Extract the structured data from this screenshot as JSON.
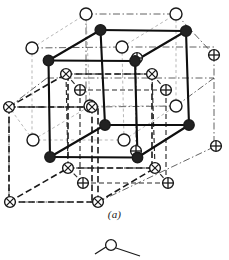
{
  "figure": {
    "caption": "(a)",
    "caption_letter": "a",
    "colors": {
      "line": "#1a1a1a",
      "filled_atom": "#222222",
      "open_atom": "#ffffff",
      "stroke": "#1a1a1a",
      "background": "#ffffff",
      "faint_line": "#7a7a7a"
    },
    "legend_atom_types": [
      {
        "key": "filled",
        "symbol": "filled-circle",
        "name": "filled-atom"
      },
      {
        "key": "open",
        "symbol": "open-circle",
        "name": "open-atom"
      },
      {
        "key": "cross",
        "symbol": "circle-with-x",
        "name": "x-cross-atom"
      },
      {
        "key": "plus",
        "symbol": "circle-with-plus",
        "name": "plus-cross-atom"
      }
    ],
    "geometry": {
      "comment_axes": "projection vectors used to place lattice sites",
      "origin": [
        50,
        157
      ],
      "vec_x": [
        68,
        0
      ],
      "vec_y": [
        0,
        -68
      ],
      "vec_z": [
        38,
        -29
      ]
    },
    "atoms": {
      "filled": [
        {
          "x": 48.5,
          "y": 60.5,
          "r": 5.2
        },
        {
          "x": 100.5,
          "y": 30.0,
          "r": 5.4
        },
        {
          "x": 186.0,
          "y": 31.0,
          "r": 5.4
        },
        {
          "x": 135.0,
          "y": 61.0,
          "r": 5.2
        },
        {
          "x": 50.0,
          "y": 157.0,
          "r": 5.2
        },
        {
          "x": 105.0,
          "y": 125.0,
          "r": 5.2
        },
        {
          "x": 189.0,
          "y": 125.0,
          "r": 5.2
        },
        {
          "x": 137.5,
          "y": 157.5,
          "r": 5.2
        }
      ],
      "open": [
        {
          "x": 86.0,
          "y": 14.0,
          "r": 6.0
        },
        {
          "x": 176.0,
          "y": 14.0,
          "r": 6.0
        },
        {
          "x": 32.0,
          "y": 48.0,
          "r": 6.0
        },
        {
          "x": 122.0,
          "y": 47.0,
          "r": 6.0
        },
        {
          "x": 33.0,
          "y": 140.0,
          "r": 6.0
        },
        {
          "x": 124.0,
          "y": 140.0,
          "r": 6.0
        },
        {
          "x": 90.0,
          "y": 106.0,
          "r": 6.0
        },
        {
          "x": 176.0,
          "y": 106.0,
          "r": 6.0
        }
      ],
      "cross_x": [
        {
          "x": 66.0,
          "y": 74.0,
          "r": 5.4
        },
        {
          "x": 152.0,
          "y": 74.0,
          "r": 5.4
        },
        {
          "x": 9.0,
          "y": 107.0,
          "r": 5.4
        },
        {
          "x": 92.0,
          "y": 107.0,
          "r": 5.4
        },
        {
          "x": 68.0,
          "y": 168.0,
          "r": 5.4
        },
        {
          "x": 155.0,
          "y": 168.0,
          "r": 5.4
        },
        {
          "x": 10.0,
          "y": 202.0,
          "r": 5.4
        },
        {
          "x": 98.0,
          "y": 202.0,
          "r": 5.4
        }
      ],
      "cross_plus": [
        {
          "x": 80.0,
          "y": 90.0,
          "r": 5.4
        },
        {
          "x": 166.0,
          "y": 90.0,
          "r": 5.4
        },
        {
          "x": 214.0,
          "y": 55.0,
          "r": 5.4
        },
        {
          "x": 83.0,
          "y": 183.0,
          "r": 5.4
        },
        {
          "x": 168.0,
          "y": 183.0,
          "r": 5.4
        },
        {
          "x": 216.0,
          "y": 146.0,
          "r": 5.4
        },
        {
          "x": 136.0,
          "y": 151.0,
          "r": 5.4
        },
        {
          "x": 137.0,
          "y": 58.0,
          "r": 5.4
        }
      ]
    }
  },
  "sub_figure": {
    "label": "partial-next-figure",
    "visible": true
  }
}
